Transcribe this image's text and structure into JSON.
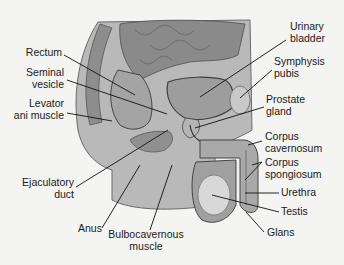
{
  "diagram": {
    "type": "anatomical-illustration",
    "colors": {
      "background": "#f4f4f2",
      "tissue_dark": "#555555",
      "tissue_mid": "#9a9a9a",
      "tissue_light": "#cfcfcf",
      "text": "#1a1a1a",
      "leader": "#111111"
    },
    "labels": {
      "rectum": "Rectum",
      "seminal_vesicle_1": "Seminal",
      "seminal_vesicle_2": "vesicle",
      "levator_1": "Levator",
      "levator_2": "ani muscle",
      "ejaculatory_1": "Ejaculatory",
      "ejaculatory_2": "duct",
      "anus": "Anus",
      "bulbo_1": "Bulbocavernous",
      "bulbo_2": "muscle",
      "bladder_1": "Urinary",
      "bladder_2": "bladder",
      "symphysis_1": "Symphysis",
      "symphysis_2": "pubis",
      "prostate_1": "Prostate",
      "prostate_2": "gland",
      "cavernosum_1": "Corpus",
      "cavernosum_2": "cavernosum",
      "spongiosum_1": "Corpus",
      "spongiosum_2": "spongiosum",
      "urethra": "Urethra",
      "testis": "Testis",
      "glans": "Glans"
    }
  }
}
